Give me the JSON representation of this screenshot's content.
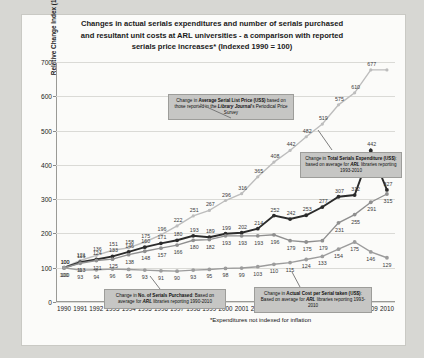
{
  "chart_data": {
    "type": "line",
    "title": "Changes in actual serials expenditures and number of serials purchased and resultant unit costs at ARL universities - a comparison with reported serials price increases* (Indexed 1990 = 100)",
    "title_line1": "Changes in actual serials expenditures and number of serials purchased",
    "title_line2": "and resultant unit costs at ARL universities - a comparison with reported",
    "title_line3": "serials price increases* (Indexed 1990 = 100)",
    "xlabel": "",
    "ylabel": "Relative Change Index (1990 = 100)",
    "ylim": [
      0,
      700
    ],
    "yticks": [
      0,
      100,
      200,
      300,
      400,
      500,
      600,
      700
    ],
    "grid": true,
    "legend": "none",
    "footnote": "*Expenditures not indexed for inflation",
    "categories": [
      "1990",
      "1991",
      "1992",
      "1993",
      "1994",
      "1995",
      "1996",
      "1997",
      "1998",
      "1999",
      "2000",
      "2001",
      "2002",
      "2003",
      "2004",
      "2005",
      "2006",
      "2007",
      "2008",
      "2009",
      "2010"
    ],
    "series": [
      {
        "name": "Average Serial List Price (US$)",
        "color": "#bdbdbd",
        "values": [
          100,
          121,
          136,
          151,
          158,
          175,
          196,
          222,
          251,
          267,
          296,
          316,
          365,
          408,
          442,
          482,
          519,
          575,
          610,
          677,
          677
        ],
        "labels": [
          "100",
          "121",
          "136",
          "151",
          "158",
          "175",
          "196",
          "222",
          "251",
          "267",
          "296",
          "316",
          "365",
          "408",
          "442",
          "482",
          "519",
          "575",
          "610",
          "677",
          ""
        ]
      },
      {
        "name": "Total Serials Expenditure (US$)",
        "color": "#2b2b2b",
        "values": [
          100,
          116,
          124,
          133,
          146,
          160,
          171,
          180,
          193,
          189,
          199,
          202,
          214,
          252,
          242,
          253,
          277,
          307,
          312,
          442,
          327
        ],
        "labels": [
          "100",
          "116",
          "124",
          "133",
          "146",
          "160",
          "171",
          "180",
          "193",
          "189",
          "199",
          "202",
          "214",
          "252",
          "242",
          "253",
          "277",
          "307",
          "312",
          "442",
          "327"
        ]
      },
      {
        "name": "Actual Cost per Serial taken (US$)",
        "color": "#8f8f8f",
        "values": [
          100,
          113,
          121,
          125,
          138,
          148,
          157,
          166,
          180,
          182,
          193,
          193,
          193,
          196,
          179,
          175,
          179,
          231,
          255,
          291,
          315
        ],
        "labels": [
          "100",
          "113",
          "121",
          "125",
          "138",
          "148",
          "157",
          "166",
          "180",
          "182",
          "193",
          "193",
          "193",
          "196",
          "179",
          "175",
          "179",
          "231",
          "255",
          "291",
          "315"
        ]
      },
      {
        "name": "No. of Serials Purchased",
        "color": "#9c9c9c",
        "values": [
          100,
          93,
          94,
          96,
          95,
          93,
          91,
          90,
          93,
          95,
          98,
          99,
          103,
          110,
          115,
          124,
          133,
          154,
          175,
          146,
          129
        ],
        "labels": [
          "100",
          "93",
          "94",
          "96",
          "95",
          "93",
          "91",
          "90",
          "93",
          "95",
          "98",
          "99",
          "103",
          "110",
          "115",
          "124",
          "133",
          "154",
          "175",
          "146",
          "129"
        ]
      }
    ],
    "end_labels": [
      {
        "text": "677",
        "series": 0
      },
      {
        "text": "327",
        "series": 1
      },
      {
        "text": "315",
        "series": 2
      },
      {
        "text": "117",
        "series": 3
      },
      {
        "text": "109",
        "series": 3
      }
    ],
    "annotations": [
      {
        "id": "price-callout",
        "html_parts": [
          "Change in ",
          "Average Serial List Price (US$)",
          " based on those reported in the ",
          "Library Journal",
          "'s Periodical Price Survey"
        ],
        "text": "Change in Average Serial List Price (US$) based on those reported in the Library Journal's Periodical Price Survey"
      },
      {
        "id": "expenditure-callout",
        "html_parts": [
          "Change in ",
          "Total Serials Expenditure (US$)",
          ": based on average for ",
          "ARL",
          " libraries reporting 1993-2010"
        ],
        "text": "Change in Total Serials Expenditure (US$): based on average for ARL libraries reporting 1993-2010"
      },
      {
        "id": "serials-purchased-callout",
        "html_parts": [
          "Change in ",
          "No. of Serials Purchased",
          ": Based on average for ",
          "ARL",
          " libraries reporting 1990-2010"
        ],
        "text": "Change in No. of Serials Purchased: Based on average for ARL libraries reporting 1990-2010"
      },
      {
        "id": "cost-per-serial-callout",
        "html_parts": [
          "Change in ",
          "Actual Cost per Serial taken (US$)",
          ": Based on average for ",
          "ARL",
          " libraries reporting 1993-2010"
        ],
        "text": "Change in Actual Cost per Serial taken (US$): Based on average for ARL libraries reporting 1993-2010"
      }
    ]
  }
}
